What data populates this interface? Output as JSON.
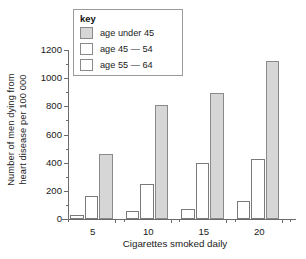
{
  "chart_data": {
    "type": "bar",
    "title": "",
    "xlabel": "Cigarettes smoked daily",
    "ylabel": "Number of men dying from heart disease per 100 000",
    "ylabel_lines": [
      "Number of men dying from",
      "heart disease per 100 000"
    ],
    "categories": [
      "5",
      "10",
      "15",
      "20"
    ],
    "series": [
      {
        "name": "age under 45",
        "values": [
          25,
          60,
          70,
          130
        ],
        "color": "#ffffff"
      },
      {
        "name": "age 45 — 54",
        "values": [
          160,
          250,
          400,
          425
        ],
        "color": "#ffffff"
      },
      {
        "name": "age 55 — 64",
        "values": [
          465,
          810,
          895,
          1120
        ],
        "color": "#d6d6d6"
      }
    ],
    "ylim": [
      0,
      1200
    ],
    "ytick_labels": [
      "0",
      "200",
      "400",
      "600",
      "800",
      "1000",
      "1200"
    ],
    "ytick_values": [
      0,
      200,
      400,
      600,
      800,
      1000,
      1200
    ],
    "yminor_values": [
      100,
      300,
      500,
      700,
      900,
      1100
    ],
    "grid": false,
    "legend_position": "top-left-inside"
  },
  "legend": {
    "title": "key",
    "entries": [
      {
        "label": "age under 45",
        "swatch": "gray"
      },
      {
        "label": "age 45 — 54",
        "swatch": "white"
      },
      {
        "label": "age 55 — 64",
        "swatch": "white"
      }
    ]
  },
  "colors": {
    "bar_gray": "#d6d6d6",
    "bar_white": "#ffffff",
    "outline": "#8a8a8a",
    "axis": "#6b6b6b",
    "text": "#1a1a1a",
    "background": "#ffffff"
  }
}
